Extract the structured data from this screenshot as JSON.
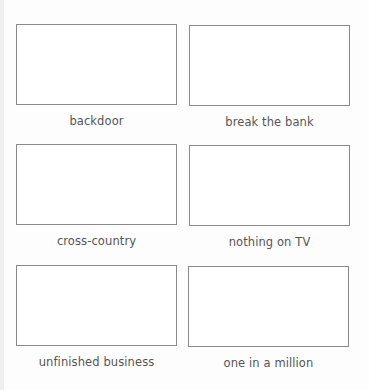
{
  "worksheet": {
    "cards": [
      {
        "label": "backdoor"
      },
      {
        "label": "break the bank"
      },
      {
        "label": "cross-country"
      },
      {
        "label": "nothing on TV"
      },
      {
        "label": "unfinished business"
      },
      {
        "label": "one in a million"
      }
    ]
  },
  "colors": {
    "border": "#8a8a8a",
    "text": "#555555",
    "background": "#fdfdfd"
  }
}
